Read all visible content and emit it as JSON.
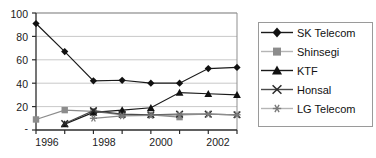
{
  "chart_data": {
    "type": "line",
    "title": "",
    "xlabel": "",
    "ylabel": "",
    "x": [
      1996,
      1997,
      1998,
      1999,
      2000,
      2001,
      2002,
      2003
    ],
    "xtick_labels": [
      "1996",
      "",
      "1998",
      "",
      "2000",
      "",
      "2002",
      ""
    ],
    "xtick_labels_shown": [
      "1996",
      "1998",
      "2000",
      "2002"
    ],
    "ytick_labels": [
      "-",
      "20",
      "40",
      "60",
      "80",
      "100"
    ],
    "yticks": [
      0,
      20,
      40,
      60,
      80,
      100
    ],
    "ylim": [
      0,
      100
    ],
    "xlim": [
      1996,
      2003
    ],
    "grid": true,
    "grid_axis": "y",
    "legend_position": "right",
    "series": [
      {
        "name": "SK Telecom",
        "marker": "diamond",
        "color": "#1a1a1a",
        "x": [
          1996,
          1997,
          1998,
          1999,
          2000,
          2001,
          2002,
          2003
        ],
        "values": [
          91,
          67,
          42,
          42.5,
          40,
          40,
          52.5,
          53.5
        ]
      },
      {
        "name": "Shinsegi",
        "marker": "square",
        "color": "#8c8c8c",
        "x": [
          1996,
          1997,
          1998,
          1999,
          2000,
          2001
        ],
        "values": [
          9,
          17,
          16,
          13,
          13,
          11
        ]
      },
      {
        "name": "KTF",
        "marker": "triangle",
        "color": "#1a1a1a",
        "x": [
          1997,
          1998,
          1999,
          2000,
          2001,
          2002,
          2003
        ],
        "values": [
          5,
          15,
          17,
          19,
          32,
          31,
          30
        ]
      },
      {
        "name": "Honsal",
        "marker": "x",
        "color": "#4a4a4a",
        "x": [
          1997,
          1998,
          1999,
          2000,
          2001,
          2002,
          2003
        ],
        "values": [
          5.5,
          16.5,
          13.5,
          13,
          13.5,
          13.5,
          13
        ]
      },
      {
        "name": "LG Telecom",
        "marker": "asterisk",
        "color": "#8c8c8c",
        "x": [
          1998,
          1999,
          2000,
          2001,
          2002,
          2003
        ],
        "values": [
          10,
          12,
          12.5,
          13,
          13.5,
          13
        ]
      }
    ]
  },
  "legend": {
    "entries": [
      {
        "label": "SK Telecom"
      },
      {
        "label": "Shinsegi"
      },
      {
        "label": "KTF"
      },
      {
        "label": "Honsal"
      },
      {
        "label": "LG Telecom"
      }
    ]
  }
}
